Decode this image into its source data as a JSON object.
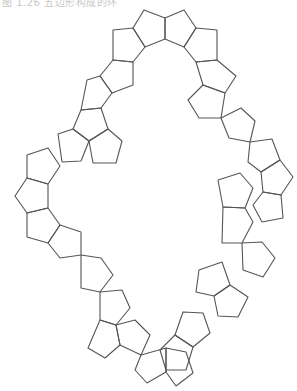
{
  "caption": {
    "text": "图 1.26 五边形构成的环"
  },
  "diagram": {
    "stroke_color": "#555555",
    "background": "#ffffff",
    "pentagons": [
      [
        [
          144,
          10
        ],
        [
          165,
          18
        ],
        [
          165,
          39
        ],
        [
          145,
          47
        ],
        [
          133,
          28
        ]
      ],
      [
        [
          165,
          18
        ],
        [
          184,
          10
        ],
        [
          196,
          28
        ],
        [
          184,
          47
        ],
        [
          165,
          39
        ]
      ],
      [
        [
          113,
          30
        ],
        [
          133,
          28
        ],
        [
          145,
          47
        ],
        [
          133,
          62
        ],
        [
          113,
          60
        ]
      ],
      [
        [
          196,
          28
        ],
        [
          217,
          30
        ],
        [
          217,
          60
        ],
        [
          196,
          62
        ],
        [
          184,
          47
        ]
      ],
      [
        [
          113,
          60
        ],
        [
          133,
          62
        ],
        [
          133,
          85
        ],
        [
          112,
          93
        ],
        [
          100,
          76
        ]
      ],
      [
        [
          217,
          60
        ],
        [
          236,
          76
        ],
        [
          225,
          93
        ],
        [
          203,
          85
        ],
        [
          196,
          62
        ]
      ],
      [
        [
          87,
          80
        ],
        [
          100,
          76
        ],
        [
          112,
          93
        ],
        [
          101,
          108
        ],
        [
          81,
          110
        ]
      ],
      [
        [
          203,
          85
        ],
        [
          225,
          93
        ],
        [
          221,
          118
        ],
        [
          199,
          118
        ],
        [
          188,
          100
        ]
      ],
      [
        [
          81,
          110
        ],
        [
          101,
          108
        ],
        [
          108,
          129
        ],
        [
          89,
          141
        ],
        [
          73,
          129
        ]
      ],
      [
        [
          221,
          118
        ],
        [
          241,
          108
        ],
        [
          255,
          121
        ],
        [
          250,
          142
        ],
        [
          229,
          138
        ]
      ],
      [
        [
          89,
          141
        ],
        [
          108,
          129
        ],
        [
          122,
          141
        ],
        [
          116,
          163
        ],
        [
          93,
          163
        ]
      ],
      [
        [
          250,
          142
        ],
        [
          272,
          139
        ],
        [
          280,
          160
        ],
        [
          261,
          172
        ],
        [
          248,
          162
        ]
      ],
      [
        [
          58,
          134
        ],
        [
          73,
          129
        ],
        [
          89,
          141
        ],
        [
          81,
          161
        ],
        [
          62,
          162
        ]
      ],
      [
        [
          261,
          172
        ],
        [
          280,
          160
        ],
        [
          293,
          177
        ],
        [
          281,
          195
        ],
        [
          263,
          192
        ]
      ],
      [
        [
          27,
          155
        ],
        [
          48,
          148
        ],
        [
          60,
          166
        ],
        [
          48,
          184
        ],
        [
          27,
          178
        ]
      ],
      [
        [
          263,
          192
        ],
        [
          281,
          195
        ],
        [
          283,
          218
        ],
        [
          262,
          222
        ],
        [
          253,
          205
        ]
      ],
      [
        [
          27,
          178
        ],
        [
          48,
          184
        ],
        [
          48,
          208
        ],
        [
          27,
          213
        ],
        [
          15,
          196
        ]
      ],
      [
        [
          218,
          180
        ],
        [
          240,
          173
        ],
        [
          253,
          188
        ],
        [
          245,
          208
        ],
        [
          223,
          207
        ]
      ],
      [
        [
          27,
          213
        ],
        [
          48,
          208
        ],
        [
          60,
          225
        ],
        [
          48,
          243
        ],
        [
          27,
          237
        ]
      ],
      [
        [
          223,
          207
        ],
        [
          245,
          208
        ],
        [
          253,
          222
        ],
        [
          242,
          243
        ],
        [
          222,
          243
        ]
      ],
      [
        [
          48,
          243
        ],
        [
          60,
          225
        ],
        [
          81,
          232
        ],
        [
          81,
          255
        ],
        [
          60,
          258
        ]
      ],
      [
        [
          242,
          243
        ],
        [
          262,
          242
        ],
        [
          275,
          258
        ],
        [
          263,
          277
        ],
        [
          243,
          270
        ]
      ],
      [
        [
          81,
          255
        ],
        [
          101,
          258
        ],
        [
          113,
          275
        ],
        [
          100,
          292
        ],
        [
          81,
          288
        ]
      ],
      [
        [
          199,
          270
        ],
        [
          222,
          262
        ],
        [
          230,
          285
        ],
        [
          214,
          296
        ],
        [
          196,
          292
        ]
      ],
      [
        [
          100,
          292
        ],
        [
          122,
          290
        ],
        [
          130,
          308
        ],
        [
          116,
          325
        ],
        [
          100,
          320
        ]
      ],
      [
        [
          214,
          296
        ],
        [
          230,
          285
        ],
        [
          248,
          297
        ],
        [
          238,
          317
        ],
        [
          218,
          316
        ]
      ],
      [
        [
          100,
          320
        ],
        [
          116,
          325
        ],
        [
          120,
          345
        ],
        [
          105,
          358
        ],
        [
          88,
          348
        ]
      ],
      [
        [
          183,
          312
        ],
        [
          203,
          313
        ],
        [
          210,
          333
        ],
        [
          193,
          347
        ],
        [
          175,
          335
        ]
      ],
      [
        [
          116,
          325
        ],
        [
          135,
          320
        ],
        [
          150,
          335
        ],
        [
          141,
          355
        ],
        [
          120,
          345
        ]
      ],
      [
        [
          175,
          335
        ],
        [
          193,
          347
        ],
        [
          186,
          370
        ],
        [
          166,
          370
        ],
        [
          160,
          350
        ]
      ],
      [
        [
          141,
          355
        ],
        [
          166,
          348
        ],
        [
          166,
          372
        ],
        [
          147,
          383
        ],
        [
          135,
          370
        ]
      ],
      [
        [
          166,
          348
        ],
        [
          186,
          352
        ],
        [
          193,
          373
        ],
        [
          176,
          386
        ],
        [
          166,
          372
        ]
      ]
    ]
  }
}
